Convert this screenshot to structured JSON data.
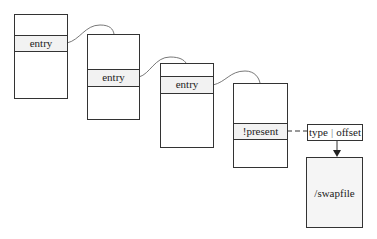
{
  "diagram": {
    "tables": [
      {
        "row_label": "entry"
      },
      {
        "row_label": "entry"
      },
      {
        "row_label": "entry"
      },
      {
        "row_label": "!present"
      }
    ],
    "swap_entry": {
      "type_label": "type",
      "separator": "|",
      "offset_label": "offset"
    },
    "swap_target": {
      "label": "/swapfile"
    }
  }
}
